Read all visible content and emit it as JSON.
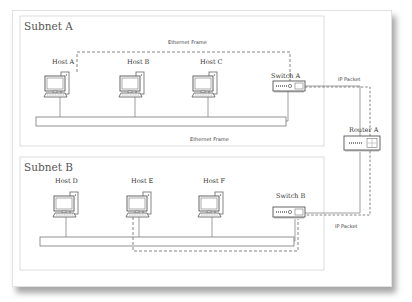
{
  "subnets": [
    {
      "title": "Subnet A",
      "hosts": [
        "Host A",
        "Host B",
        "Host C"
      ],
      "switch": "Switch A",
      "frame_label_top": "Ethernet Frame",
      "frame_label_bottom": "Ethernet Frame"
    },
    {
      "title": "Subnet B",
      "hosts": [
        "Host D",
        "Host E",
        "Host F"
      ],
      "switch": "Switch B"
    }
  ],
  "router": "Router A",
  "packet_labels": {
    "top": "IP Packet",
    "bottom": "IP Packet"
  },
  "colors": {
    "line": "#777777",
    "dashed": "#666666",
    "box_border": "#d4d4d4"
  },
  "icons": [
    "computer-icon",
    "switch-icon",
    "router-icon"
  ]
}
